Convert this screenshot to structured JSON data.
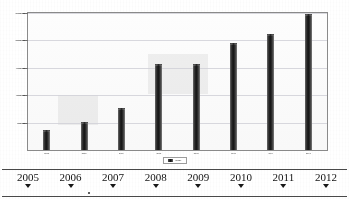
{
  "chart_data": {
    "type": "bar",
    "title": "",
    "xlabel": "",
    "ylabel": "",
    "categories": [
      "2005",
      "2006",
      "2007",
      "2008",
      "2009",
      "2010",
      "2011",
      "2012"
    ],
    "values": [
      350000,
      500000,
      750000,
      1550000,
      1560000,
      1930000,
      2100000,
      2470000
    ],
    "ylim": [
      0,
      2500000
    ],
    "yticks": [
      500000,
      1000000,
      1500000,
      2000000,
      2500000
    ],
    "ytick_labels": [
      "500.000",
      "1.000.000",
      "1.500.000",
      "2.000.000",
      "2.500.000"
    ],
    "grid": true,
    "legend_position": "bottom",
    "legend": [
      "Serie1"
    ],
    "bar_color": "#1a1a1a"
  },
  "chart": {
    "legend_label": "Serie1"
  },
  "timeline": {
    "years": [
      "2005",
      "2006",
      "2007",
      "2008",
      "2009",
      "2010",
      "2011",
      "2012"
    ],
    "marker_icon": "triangle-down-icon"
  }
}
